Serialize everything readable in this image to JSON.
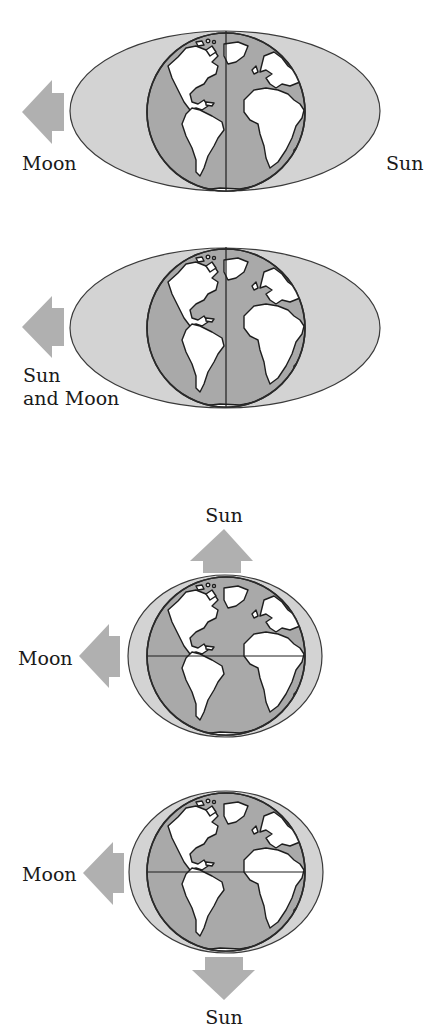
{
  "diagram": {
    "colors": {
      "tidal_bulge": "#d3d3d3",
      "ocean": "#a9a9a9",
      "land": "#ffffff",
      "arrow": "#b0b0b0",
      "outline": "#1e1e1e"
    },
    "panels": [
      {
        "id": "panel-1",
        "view": "polar axis vertical, elongated bulge",
        "labels": {
          "moon": "Moon",
          "sun": "Sun"
        },
        "arrow_direction": "left",
        "arrow_target": "Moon"
      },
      {
        "id": "panel-2",
        "view": "polar axis vertical, elongated bulge",
        "labels": {
          "sun_and_moon_line1": "Sun",
          "sun_and_moon_line2": "and Moon"
        },
        "arrow_direction": "left",
        "arrow_target": "Sun and Moon"
      },
      {
        "id": "panel-3",
        "view": "equator horizontal, small bulge",
        "labels": {
          "moon": "Moon",
          "sun": "Sun"
        },
        "arrows": [
          {
            "direction": "left",
            "target": "Moon"
          },
          {
            "direction": "up",
            "target": "Sun"
          }
        ]
      },
      {
        "id": "panel-4",
        "view": "equator horizontal, small bulge",
        "labels": {
          "moon": "Moon",
          "sun": "Sun"
        },
        "arrows": [
          {
            "direction": "left",
            "target": "Moon"
          },
          {
            "direction": "down",
            "target": "Sun"
          }
        ]
      }
    ]
  }
}
